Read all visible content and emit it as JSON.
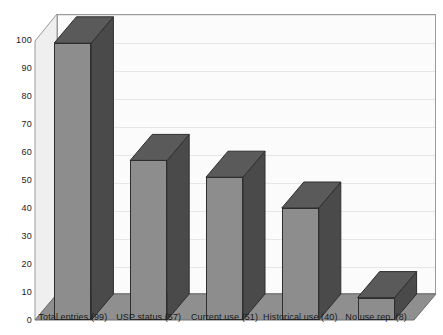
{
  "chart_data": {
    "type": "bar",
    "title": "",
    "subtitle": "",
    "xlabel": "",
    "ylabel": "",
    "categories": [
      "Total entries (99)",
      "USP status (57)",
      "Current use (51)",
      "Historical use (40)",
      "No use rep. (8)"
    ],
    "values": [
      99,
      57,
      51,
      40,
      8
    ],
    "ylim": [
      0,
      100
    ],
    "yticks": [
      0,
      10,
      20,
      30,
      40,
      50,
      60,
      70,
      80,
      90,
      100
    ],
    "ytick_labels": [
      "0",
      "10",
      "20",
      "30",
      "40",
      "50",
      "60",
      "70",
      "80",
      "90",
      "100"
    ],
    "grid": true,
    "legend": "none",
    "style": "3d-column",
    "colors": {
      "bar_front": "#8d8d8d",
      "bar_side": "#4a4a4a",
      "bar_top": "#5a5a5a",
      "bar_outline": "#2e2e2e",
      "back_wall": "#fbfbfb",
      "side_wall": "#efefef",
      "floor": "#8f8f8f",
      "gridline": "#e6e6e6",
      "axis_line": "#9a9a9a",
      "text": "#1a1a1a"
    }
  }
}
